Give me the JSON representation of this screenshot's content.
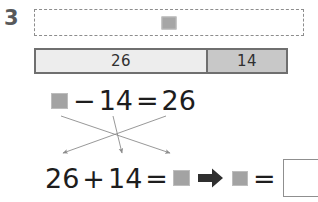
{
  "worksheet": {
    "problem_number": "3",
    "work_area": {
      "name": "dashed-work-box",
      "placeholder_symbol": "unknown-square"
    },
    "bar_model": {
      "segments": [
        {
          "label": "26",
          "fill": "#ededed"
        },
        {
          "label": "14",
          "fill": "#c8c8c8"
        }
      ]
    },
    "equation_top": {
      "tokens": [
        "unknown-square",
        "−",
        "14",
        "=",
        "26"
      ],
      "minus": "−",
      "value_14": "14",
      "equals": "=",
      "value_26": "26"
    },
    "equation_bottom": {
      "value_26": "26",
      "plus": "+",
      "value_14": "14",
      "equals_1": "=",
      "result_symbol": "unknown-square",
      "implication": "➡",
      "answer_symbol": "unknown-square",
      "equals_2": "=",
      "answer_box_value": ""
    },
    "guide_arrows": [
      {
        "name": "arrow-unknown-to-result",
        "from": [
          61,
          116
        ],
        "to": [
          170,
          154
        ]
      },
      {
        "name": "arrow-14-to-14",
        "from": [
          113,
          116
        ],
        "to": [
          122,
          154
        ]
      },
      {
        "name": "arrow-26-to-26",
        "from": [
          166,
          116
        ],
        "to": [
          63,
          154
        ]
      }
    ],
    "colors": {
      "unknown_square": "#a3a3a3",
      "bar_left": "#ededed",
      "bar_right": "#c8c8c8",
      "bar_border": "#6f6f6f",
      "text": "#1d1d1d",
      "number_label": "#58595b",
      "arrow": "#8c8c8c",
      "implication_arrow": "#2f2f2f"
    }
  }
}
